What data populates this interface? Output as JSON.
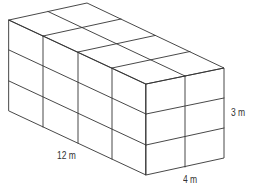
{
  "diagram": {
    "type": "rectangular-prism-unit-cubes",
    "length_label": "12 m",
    "height_label": "3 m",
    "width_label": "4 m",
    "cubes_long": 4,
    "cubes_wide": 2,
    "cubes_high": 3,
    "line_color": "#333333"
  }
}
